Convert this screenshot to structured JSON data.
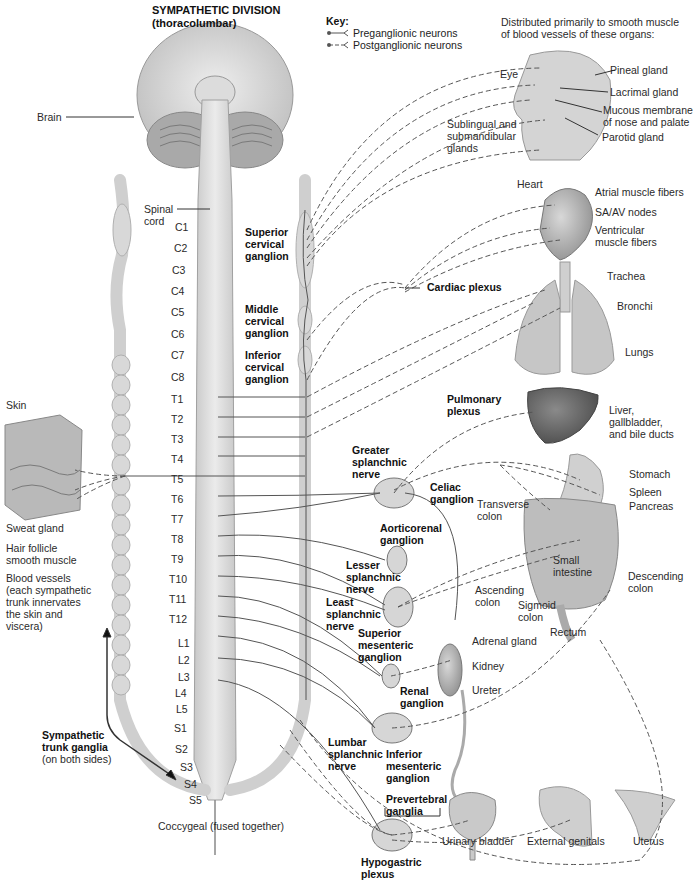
{
  "title": {
    "line1": "SYMPATHETIC DIVISION",
    "line2": "(thoracolumbar)"
  },
  "key": {
    "heading": "Key:",
    "preganglionic": "Preganglionic neurons",
    "postganglionic": "Postganglionic neurons"
  },
  "distribution_note": {
    "line1": "Distributed primarily to smooth muscle",
    "line2": "of blood vessels of these organs:"
  },
  "left_labels": {
    "brain": "Brain",
    "spinal_cord": [
      "Spinal",
      "cord"
    ],
    "skin": "Skin",
    "sweat_gland": "Sweat gland",
    "hair_follicle": [
      "Hair follicle",
      "smooth muscle"
    ],
    "blood_vessels": [
      "Blood vessels",
      "(each sympathetic",
      "trunk innervates",
      "the skin and",
      "viscera)"
    ],
    "trunk_ganglia": [
      "Sympathetic",
      "trunk ganglia"
    ],
    "trunk_ganglia_note": "(on both sides)",
    "coccygeal": "Coccygeal (fused together)"
  },
  "segments": [
    "C1",
    "C2",
    "C3",
    "C4",
    "C5",
    "C6",
    "C7",
    "C8",
    "T1",
    "T2",
    "T3",
    "T4",
    "T5",
    "T6",
    "T7",
    "T8",
    "T9",
    "T10",
    "T11",
    "T12",
    "L1",
    "L2",
    "L3",
    "L4",
    "L5",
    "S1",
    "S2",
    "S3",
    "S4",
    "S5"
  ],
  "ganglia_labels": {
    "superior_cervical": [
      "Superior",
      "cervical",
      "ganglion"
    ],
    "middle_cervical": [
      "Middle",
      "cervical",
      "ganglion"
    ],
    "inferior_cervical": [
      "Inferior",
      "cervical",
      "ganglion"
    ],
    "cardiac_plexus": "Cardiac plexus",
    "pulmonary_plexus": [
      "Pulmonary",
      "plexus"
    ],
    "greater_splanchnic": [
      "Greater",
      "splanchnic",
      "nerve"
    ],
    "celiac": [
      "Celiac",
      "ganglion"
    ],
    "aorticorenal": [
      "Aorticorenal",
      "ganglion"
    ],
    "lesser_splanchnic": [
      "Lesser",
      "splanchnic",
      "nerve"
    ],
    "least_splanchnic": [
      "Least",
      "splanchnic",
      "nerve"
    ],
    "superior_mesenteric": [
      "Superior",
      "mesenteric",
      "ganglion"
    ],
    "renal": [
      "Renal",
      "ganglion"
    ],
    "lumbar_splanchnic": [
      "Lumbar",
      "splanchnic",
      "nerve"
    ],
    "inferior_mesenteric": [
      "Inferior",
      "mesenteric",
      "ganglion"
    ],
    "prevertebral": [
      "Prevertebral",
      "ganglia"
    ],
    "hypogastric": [
      "Hypogastric",
      "plexus"
    ]
  },
  "organ_labels": {
    "eye": "Eye",
    "pineal": "Pineal gland",
    "lacrimal": "Lacrimal gland",
    "mucous": [
      "Mucous membrane",
      "of nose and palate"
    ],
    "sublingual": [
      "Sublingual and",
      "submandibular",
      "glands"
    ],
    "parotid": "Parotid gland",
    "heart": "Heart",
    "atrial": "Atrial muscle fibers",
    "saav": "SA/AV nodes",
    "ventricular": [
      "Ventricular",
      "muscle fibers"
    ],
    "trachea": "Trachea",
    "bronchi": "Bronchi",
    "lungs": "Lungs",
    "liver": [
      "Liver,",
      "gallbladder,",
      "and bile ducts"
    ],
    "stomach": "Stomach",
    "spleen": "Spleen",
    "pancreas": "Pancreas",
    "transverse_colon": [
      "Transverse",
      "colon"
    ],
    "small_intestine": [
      "Small",
      "intestine"
    ],
    "descending_colon": [
      "Descending",
      "colon"
    ],
    "ascending_colon": [
      "Ascending",
      "colon"
    ],
    "sigmoid_colon": [
      "Sigmoid",
      "colon"
    ],
    "rectum": "Rectum",
    "adrenal": "Adrenal gland",
    "kidney": "Kidney",
    "ureter": "Ureter",
    "bladder": "Urinary bladder",
    "genitals": "External genitals",
    "uterus": "Uterus"
  },
  "colors": {
    "tissue": "#d9d9d9",
    "tissue_dark": "#a8a8a8",
    "ganglion_fill": "#d4d4d4",
    "nerve": "#555555"
  }
}
